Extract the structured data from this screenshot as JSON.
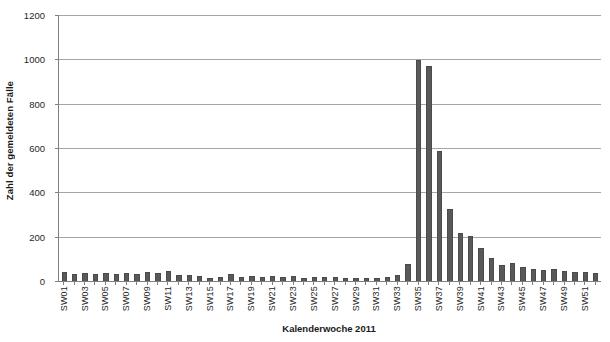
{
  "chart_data": {
    "type": "bar",
    "title": "",
    "subtitle": "",
    "xlabel": "Kalenderwoche 2011",
    "ylabel": "Zahl der gemeldeten Fälle",
    "ylim": [
      0,
      1200
    ],
    "y_ticks": [
      0,
      200,
      400,
      600,
      800,
      1000,
      1200
    ],
    "y_tick_labels": [
      "0",
      "200",
      "400",
      "600",
      "800",
      "1000",
      "1200"
    ],
    "grid": "horizontal",
    "legend": "none",
    "bar_color": "#595959",
    "bar_edge_color": "#4a4a4a",
    "gridline_color": "#a6a6a6",
    "axis_color": "#7f7f7f",
    "categories": [
      "SW01",
      "SW02",
      "SW03",
      "SW04",
      "SW05",
      "SW06",
      "SW07",
      "SW08",
      "SW09",
      "SW10",
      "SW11",
      "SW12",
      "SW13",
      "SW14",
      "SW15",
      "SW16",
      "SW17",
      "SW18",
      "SW19",
      "SW20",
      "SW21",
      "SW22",
      "SW23",
      "SW24",
      "SW25",
      "SW26",
      "SW27",
      "SW28",
      "SW29",
      "SW30",
      "SW31",
      "SW32",
      "SW33",
      "SW34",
      "SW35",
      "SW36",
      "SW37",
      "SW38",
      "SW39",
      "SW40",
      "SW41",
      "SW42",
      "SW43",
      "SW44",
      "SW45",
      "SW46",
      "SW47",
      "SW48",
      "SW49",
      "SW50",
      "SW51",
      "SW52"
    ],
    "tick_labels_shown": [
      "SW01",
      "SW03",
      "SW05",
      "SW07",
      "SW09",
      "SW11",
      "SW13",
      "SW15",
      "SW17",
      "SW19",
      "SW21",
      "SW23",
      "SW25",
      "SW27",
      "SW29",
      "SW31",
      "SW33",
      "SW35",
      "SW37",
      "SW39",
      "SW41",
      "SW43",
      "SW45",
      "SW47",
      "SW49",
      "SW51"
    ],
    "values": [
      40,
      32,
      38,
      33,
      35,
      30,
      34,
      31,
      40,
      36,
      44,
      28,
      26,
      24,
      12,
      18,
      30,
      20,
      22,
      18,
      22,
      17,
      24,
      14,
      16,
      20,
      18,
      14,
      13,
      12,
      14,
      16,
      28,
      78,
      998,
      972,
      588,
      325,
      215,
      205,
      148,
      105,
      72,
      80,
      62,
      55,
      50,
      52,
      45,
      42,
      40,
      38
    ]
  }
}
